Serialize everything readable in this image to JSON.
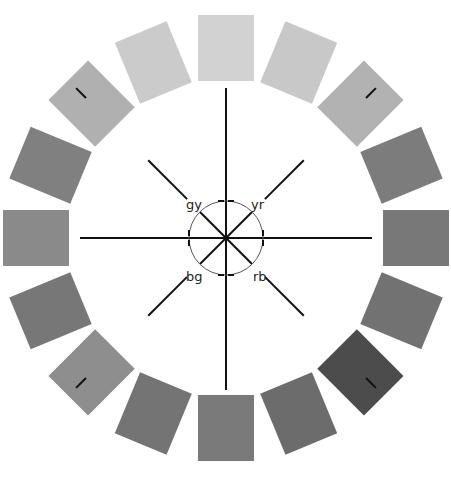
{
  "diagram": {
    "center": [
      226,
      238
    ],
    "ring_radius": 190,
    "inner_circle_radius": 37,
    "labels": [
      {
        "text": "gy",
        "x": 186,
        "y": 198
      },
      {
        "text": "yr",
        "x": 251,
        "y": 198
      },
      {
        "text": "bg",
        "x": 186,
        "y": 270
      },
      {
        "text": "rb",
        "x": 253,
        "y": 270
      }
    ],
    "swatches": [
      {
        "angle": 0,
        "color": "#d2d2d2"
      },
      {
        "angle": 22.5,
        "color": "#c8c8c8"
      },
      {
        "angle": 45,
        "color": "#b2b2b2"
      },
      {
        "angle": 67.5,
        "color": "#7c7c7c"
      },
      {
        "angle": 90,
        "color": "#787878"
      },
      {
        "angle": 112.5,
        "color": "#727272"
      },
      {
        "angle": 135,
        "color": "#4c4c4c"
      },
      {
        "angle": 157.5,
        "color": "#6c6c6c"
      },
      {
        "angle": 180,
        "color": "#7a7a7a"
      },
      {
        "angle": 202.5,
        "color": "#747474"
      },
      {
        "angle": 225,
        "color": "#8e8e8e"
      },
      {
        "angle": 247.5,
        "color": "#777777"
      },
      {
        "angle": 270,
        "color": "#8a8a8a"
      },
      {
        "angle": 292.5,
        "color": "#808080"
      },
      {
        "angle": 315,
        "color": "#b0b0b0"
      },
      {
        "angle": 337.5,
        "color": "#cbcbcb"
      }
    ],
    "tick_marks": [
      45,
      135,
      225,
      315
    ]
  }
}
